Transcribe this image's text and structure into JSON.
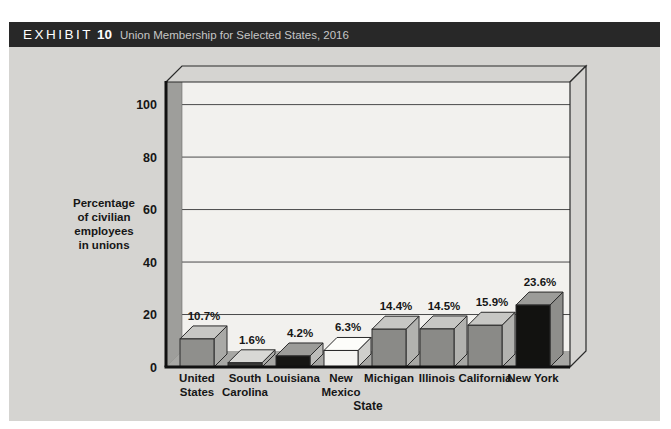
{
  "header": {
    "exhibit_label": "EXHIBIT",
    "exhibit_number": "10",
    "title": "Union Membership for Selected States, 2016"
  },
  "chart_data": {
    "type": "bar",
    "style": "pseudo-3d-bars",
    "title": "Union Membership for Selected States, 2016",
    "xlabel": "State",
    "ylabel": "Percentage of civilian employees in unions",
    "ylabel_lines": [
      "Percentage",
      "of civilian",
      "employees",
      "in unions"
    ],
    "categories": [
      "United States",
      "South Carolina",
      "Louisiana",
      "New Mexico",
      "Michigan",
      "Illinois",
      "California",
      "New York"
    ],
    "category_lines": [
      [
        "United",
        "States"
      ],
      [
        "South",
        "Carolina"
      ],
      [
        "Louisiana"
      ],
      [
        "New",
        "Mexico"
      ],
      [
        "Michigan"
      ],
      [
        "Illinois"
      ],
      [
        "California"
      ],
      [
        "New York"
      ]
    ],
    "values": [
      10.7,
      1.6,
      4.2,
      6.3,
      14.4,
      14.5,
      15.9,
      23.6
    ],
    "value_labels": [
      "10.7%",
      "1.6%",
      "4.2%",
      "6.3%",
      "14.4%",
      "14.5%",
      "15.9%",
      "23.6%"
    ],
    "yticks": [
      0,
      20,
      40,
      60,
      80,
      100
    ],
    "ylim": [
      0,
      108
    ],
    "grid": true,
    "legend": null,
    "bar_styles": [
      {
        "front": "#8f8f8c",
        "top": "#c7c7c4",
        "side": "#a9a9a6"
      },
      {
        "front": "#3a3a38",
        "top": "#d8d8d5",
        "side": "#ababa8"
      },
      {
        "front": "#161614",
        "top": "#9c9c99",
        "side": "#bcbcb9"
      },
      {
        "front": "#f5f5f2",
        "top": "#fdfdfa",
        "side": "#cfcfcc"
      },
      {
        "front": "#8a8a87",
        "top": "#c7c7c4",
        "side": "#b2b2af"
      },
      {
        "front": "#8a8a87",
        "top": "#c7c7c4",
        "side": "#b2b2af"
      },
      {
        "front": "#8a8a87",
        "top": "#c7c7c4",
        "side": "#b2b2af"
      },
      {
        "front": "#121210",
        "top": "#9c9c99",
        "side": "#8e8e8b"
      }
    ],
    "colors": {
      "panel": "#d5d4d1",
      "back_wall": "#f2f1ee",
      "left_wall": "#9e9e9b",
      "floor": "#a7a7a4",
      "outline": "#2a2a2a",
      "grid_line": "#4a4a4a",
      "axis": "#111111",
      "text": "#161616",
      "header_bg": "#282828",
      "header_text": "#ffffff",
      "header_subtitle": "#c6c6c6"
    }
  }
}
